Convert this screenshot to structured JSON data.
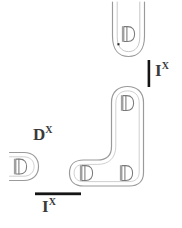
{
  "figure": {
    "title": "",
    "background_color": "#ffffff",
    "stroke_color": "#8c8c8c",
    "glyph_color": "#7a7a7a",
    "marker_color": "#1c1c1c",
    "label_color": "#3a3a3a"
  },
  "labels": {
    "d_x": {
      "base": "D",
      "superscript": "X"
    },
    "i_x_vertical": {
      "base": "I",
      "superscript": "X"
    },
    "i_x_horizontal": {
      "base": "I",
      "superscript": "X"
    }
  },
  "shapes": {
    "top_tube": {
      "name": "u-shaped-tube",
      "glyph_count": 1,
      "glyph": "D"
    },
    "l_tube": {
      "name": "l-shaped-tube",
      "glyph_count": 3,
      "glyph": "D"
    },
    "left_cap": {
      "name": "half-capsule",
      "glyph_count": 1,
      "glyph": "D"
    }
  },
  "markers": {
    "vertical_bar": {
      "name": "vertical-scale-bar",
      "orientation": "vertical"
    },
    "horizontal_bar": {
      "name": "horizontal-scale-bar",
      "orientation": "horizontal"
    }
  },
  "glyphs": {
    "d": "D"
  }
}
